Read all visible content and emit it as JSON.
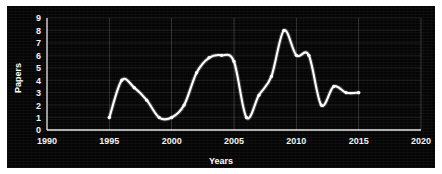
{
  "chart_data": {
    "type": "line",
    "title": "",
    "xlabel": "Years",
    "ylabel": "Papers",
    "xlim": [
      1990,
      2020
    ],
    "ylim": [
      0,
      9
    ],
    "grid": true,
    "legend": false,
    "background_color": "#050505",
    "line_color": "#ffffff",
    "grid_color": "#9a9a9a",
    "text_color": "#ffffff",
    "xticks": [
      1990,
      1995,
      2000,
      2005,
      2010,
      2015,
      2020
    ],
    "xtick_labels": [
      "1990",
      "1995",
      "2000",
      "2005",
      "2010",
      "2015",
      "2020"
    ],
    "yticks": [
      0,
      1,
      2,
      3,
      4,
      5,
      6,
      7,
      8,
      9
    ],
    "ytick_labels": [
      "0",
      "1",
      "2",
      "3",
      "4",
      "5",
      "6",
      "7",
      "8",
      "9"
    ],
    "x": [
      1995,
      1996,
      1997,
      1998,
      1999,
      2000,
      2001,
      2002,
      2003,
      2004,
      2005,
      2006,
      2007,
      2008,
      2009,
      2010,
      2011,
      2012,
      2013,
      2014,
      2015
    ],
    "values": [
      1,
      4,
      3.4,
      2.4,
      1,
      1,
      2,
      4.6,
      5.8,
      6,
      5.5,
      1,
      2.8,
      4.3,
      8,
      6,
      6,
      2,
      3.5,
      3,
      3
    ],
    "series": [
      {
        "name": "Papers",
        "x": [
          1995,
          1996,
          1997,
          1998,
          1999,
          2000,
          2001,
          2002,
          2003,
          2004,
          2005,
          2006,
          2007,
          2008,
          2009,
          2010,
          2011,
          2012,
          2013,
          2014,
          2015
        ],
        "values": [
          1,
          4,
          3.4,
          2.4,
          1,
          1,
          2,
          4.6,
          5.8,
          6,
          5.5,
          1,
          2.8,
          4.3,
          8,
          6,
          6,
          2,
          3.5,
          3,
          3
        ]
      }
    ]
  },
  "axes": {
    "y_title": "Papers",
    "x_title": "Years"
  }
}
